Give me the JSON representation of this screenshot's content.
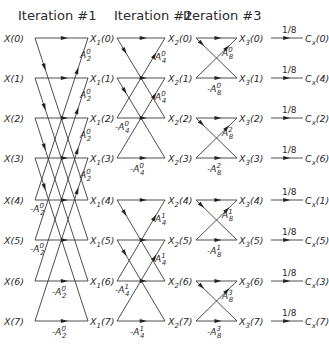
{
  "titles": [
    "Iteration #1",
    "Iteration #2",
    "Iteration #3"
  ],
  "inputs": [
    "X(0)",
    "X(1)",
    "X(2)",
    "X(3)",
    "X(4)",
    "X(5)",
    "X(6)",
    "X(7)"
  ],
  "stage1_nodes": {
    "base": "X",
    "sub": "1",
    "idx": [
      "(0)",
      "(1)",
      "(2)",
      "(3)",
      "(4)",
      "(5)",
      "(6)",
      "(7)"
    ]
  },
  "stage2_nodes": {
    "base": "X",
    "sub": "2",
    "idx": [
      "(0)",
      "(1)",
      "(2)",
      "(3)",
      "(4)",
      "(5)",
      "(6)",
      "(7)"
    ]
  },
  "stage3_nodes": {
    "base": "X",
    "sub": "3",
    "idx": [
      "(0)",
      "(1)",
      "(2)",
      "(3)",
      "(4)",
      "(5)",
      "(6)",
      "(7)"
    ]
  },
  "outputs": {
    "base": "C",
    "sub": "x",
    "idx": [
      "(0)",
      "(4)",
      "(2)",
      "(6)",
      "(1)",
      "(5)",
      "(3)",
      "(7)"
    ]
  },
  "scale_label": "1/8",
  "stage1_coeffs": {
    "upper": [
      {
        "sign": "",
        "base": "A",
        "sub": "2",
        "sup": "0"
      },
      {
        "sign": "",
        "base": "A",
        "sub": "2",
        "sup": "0"
      },
      {
        "sign": "",
        "base": "A",
        "sub": "2",
        "sup": "0"
      },
      {
        "sign": "",
        "base": "A",
        "sub": "2",
        "sup": "0"
      }
    ],
    "lower": [
      {
        "sign": "-",
        "base": "A",
        "sub": "2",
        "sup": "0"
      },
      {
        "sign": "-",
        "base": "A",
        "sub": "2",
        "sup": "0"
      },
      {
        "sign": "-",
        "base": "A",
        "sub": "2",
        "sup": "0"
      },
      {
        "sign": "-",
        "base": "A",
        "sub": "2",
        "sup": "0"
      }
    ]
  },
  "stage2_coeffs": {
    "upper": [
      {
        "sign": "",
        "base": "A",
        "sub": "4",
        "sup": "0"
      },
      {
        "sign": "",
        "base": "A",
        "sub": "4",
        "sup": "0"
      },
      {
        "sign": "",
        "base": "A",
        "sub": "4",
        "sup": "1"
      },
      {
        "sign": "",
        "base": "A",
        "sub": "4",
        "sup": "1"
      }
    ],
    "lower": [
      {
        "sign": "-",
        "base": "A",
        "sub": "4",
        "sup": "0"
      },
      {
        "sign": "-",
        "base": "A",
        "sub": "4",
        "sup": "0"
      },
      {
        "sign": "-",
        "base": "A",
        "sub": "4",
        "sup": "1"
      },
      {
        "sign": "-",
        "base": "A",
        "sub": "4",
        "sup": "1"
      }
    ]
  },
  "stage3_coeffs": {
    "upper": [
      {
        "sign": "",
        "base": "A",
        "sub": "8",
        "sup": "0"
      },
      {
        "sign": "",
        "base": "A",
        "sub": "8",
        "sup": "2"
      },
      {
        "sign": "",
        "base": "A",
        "sub": "8",
        "sup": "1"
      },
      {
        "sign": "",
        "base": "A",
        "sub": "8",
        "sup": "3"
      }
    ],
    "lower": [
      {
        "sign": "-",
        "base": "A",
        "sub": "8",
        "sup": "0"
      },
      {
        "sign": "-",
        "base": "A",
        "sub": "8",
        "sup": "2"
      },
      {
        "sign": "-",
        "base": "A",
        "sub": "8",
        "sup": "1"
      },
      {
        "sign": "-",
        "base": "A",
        "sub": "8",
        "sup": "3"
      }
    ]
  },
  "layout": {
    "rows_y": [
      38,
      78,
      118,
      158,
      200,
      240,
      281,
      321
    ],
    "stage1_x": [
      35,
      88
    ],
    "stage2_x": [
      117,
      165
    ],
    "stage3_x": [
      196,
      237
    ],
    "output_x": [
      271,
      303
    ],
    "line_color": "#3a3a3a",
    "text_color": "#2a2a2a"
  }
}
